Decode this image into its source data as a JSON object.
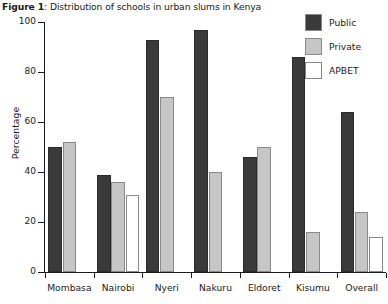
{
  "figure": {
    "label": "Figure 1",
    "separator": ": ",
    "caption": "Distribution of schools in urban slums in Kenya",
    "full_title": "Figure 1: Distribution of schools in urban slums in Kenya"
  },
  "legend": {
    "position": "top-right",
    "items": [
      {
        "label": "Public",
        "color": "#3a3a3a"
      },
      {
        "label": "Private",
        "color": "#c6c6c6"
      },
      {
        "label": "APBET",
        "color": "#ffffff"
      }
    ]
  },
  "axes": {
    "ylabel": "Percentage",
    "xlabel": "",
    "ylim": [
      0,
      100
    ],
    "yticks": [
      0,
      20,
      40,
      60,
      80,
      100
    ],
    "ytick_labels": [
      "0",
      "20",
      "40",
      "60",
      "80",
      "100"
    ],
    "grid": false
  },
  "chart_data": {
    "type": "bar",
    "title": "Figure 1: Distribution of schools in urban slums in Kenya",
    "xlabel": "",
    "ylabel": "Percentage",
    "ylim": [
      0,
      100
    ],
    "yticks": [
      0,
      20,
      40,
      60,
      80,
      100
    ],
    "grid": false,
    "legend_position": "top-right",
    "categories": [
      "Mombasa",
      "Nairobi",
      "Nyeri",
      "Nakuru",
      "Eldoret",
      "Kisumu",
      "Overall"
    ],
    "series": [
      {
        "name": "Public",
        "color": "#3a3a3a",
        "values": [
          50,
          39,
          93,
          97,
          46,
          86,
          64
        ]
      },
      {
        "name": "Private",
        "color": "#c6c6c6",
        "values": [
          52,
          36,
          70,
          40,
          50,
          16,
          24
        ]
      },
      {
        "name": "APBET",
        "color": "#ffffff",
        "values": [
          null,
          31,
          null,
          null,
          null,
          null,
          14
        ]
      }
    ]
  }
}
